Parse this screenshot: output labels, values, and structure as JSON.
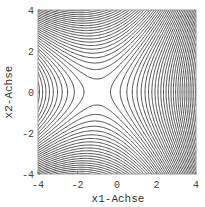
{
  "chart_data": {
    "type": "contour",
    "title": "",
    "xlabel": "x1-Achse",
    "ylabel": "x2-Achse",
    "xlim": [
      -4,
      4
    ],
    "ylim": [
      -4,
      4
    ],
    "xticks": [
      -4,
      -2,
      0,
      2,
      4
    ],
    "yticks": [
      -4,
      -2,
      0,
      2,
      4
    ],
    "xtick_labels": [
      "-4",
      "-2",
      "0",
      "2",
      "4"
    ],
    "ytick_labels": [
      "-4",
      "-2",
      "0",
      "2",
      "4"
    ],
    "grid": false,
    "legend": null,
    "saddle_point": [
      -1,
      0
    ],
    "function_model": {
      "description": "saddle surface, hyperbolic level sets centered near (-1, 0), denser on the right side",
      "form": "a*(x1+1)^2 - b*x2^2 + c*x1*x2^2",
      "a": 1.0,
      "b": 1.0,
      "c": 0.12
    },
    "contour_levels": {
      "count": 60,
      "step": 0.9,
      "start": -26.55
    },
    "line_color": "#3a3a3a",
    "frame_color": "#9a9a9a"
  }
}
